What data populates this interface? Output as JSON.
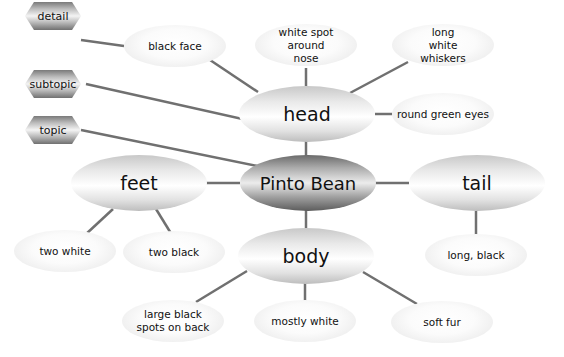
{
  "legend": [
    {
      "label": "detail"
    },
    {
      "label": "subtopic"
    },
    {
      "label": "topic"
    }
  ],
  "topic": {
    "label": "Pinto Bean"
  },
  "subtopics": {
    "head": {
      "label": "head"
    },
    "feet": {
      "label": "feet"
    },
    "tail": {
      "label": "tail"
    },
    "body": {
      "label": "body"
    }
  },
  "details": {
    "head": [
      "black face",
      "white spot around nose",
      "long white whiskers",
      "round green eyes"
    ],
    "feet": [
      "two white",
      "two black"
    ],
    "tail": [
      "long, black"
    ],
    "body": [
      "large black spots on back",
      "mostly white",
      "soft fur"
    ]
  },
  "colors": {
    "line": "#707070",
    "text": "#111111",
    "topic_dark": "#5c5c5c",
    "node_light": "#ffffff"
  }
}
